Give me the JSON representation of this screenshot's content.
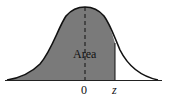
{
  "diagram": {
    "type": "normal-distribution-area",
    "area_label": "Area",
    "axis_labels": {
      "mean": "0",
      "z": "z"
    },
    "colors": {
      "shaded": "#7a7a7a",
      "curve": "#111111",
      "background": "#ffffff"
    }
  }
}
